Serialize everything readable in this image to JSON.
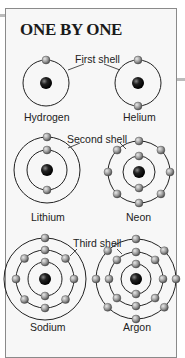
{
  "title": "ONE BY ONE",
  "shell_labels": {
    "first": "First shell",
    "second": "Second shell",
    "third": "Third shell"
  },
  "atoms": [
    {
      "name": "Hydrogen",
      "shells": [
        1
      ]
    },
    {
      "name": "Helium",
      "shells": [
        2
      ]
    },
    {
      "name": "Lithium",
      "shells": [
        2,
        1
      ]
    },
    {
      "name": "Neon",
      "shells": [
        2,
        8
      ]
    },
    {
      "name": "Sodium",
      "shells": [
        2,
        8,
        1
      ]
    },
    {
      "name": "Argon",
      "shells": [
        2,
        8,
        8
      ]
    }
  ],
  "colors": {
    "border": "#8a8a8a",
    "background": "#f7f7f7",
    "nucleus": "#1a1a1a",
    "electron": "#9a9a9a",
    "orbit": "#222222"
  }
}
